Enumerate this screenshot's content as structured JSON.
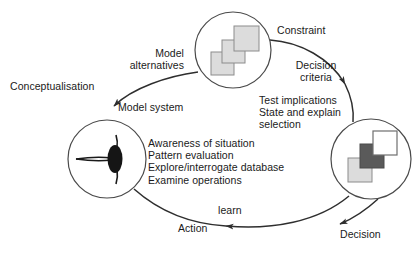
{
  "diagram": {
    "type": "cycle-diagram",
    "colors": {
      "stroke": "#3c3c3c",
      "text": "#1a1a1a",
      "square_light": "#dcdcdc",
      "square_dark": "#5a5a5a",
      "square_white": "#ffffff",
      "square_border": "#8c8c8c",
      "background": "#ffffff"
    },
    "nodes": [
      {
        "id": "model-alternatives-node",
        "position": "top",
        "icon": "three-light-squares",
        "squares": [
          {
            "name": "square-lower-left",
            "fill": "#dcdcdc"
          },
          {
            "name": "square-middle",
            "fill": "#dcdcdc"
          },
          {
            "name": "square-upper-right",
            "fill": "#dcdcdc"
          }
        ]
      },
      {
        "id": "observation-eye-node",
        "position": "left",
        "icon": "eye"
      },
      {
        "id": "decision-node",
        "position": "right",
        "icon": "three-squares-contrast",
        "squares": [
          {
            "name": "square-lower-left",
            "fill": "#dcdcdc"
          },
          {
            "name": "square-middle",
            "fill": "#5a5a5a"
          },
          {
            "name": "square-upper-right",
            "fill": "#ffffff"
          }
        ]
      }
    ],
    "labels": {
      "conceptualisation": "Conceptualisation",
      "model_alternatives": "Model\nalternatives",
      "model_system": "Model system",
      "constraint": "Constraint",
      "decision_criteria": "Decision\ncriteria",
      "test_block": "Test implications\nState and explain\nselection",
      "center_block": "Awareness of situation\nPattern evaluation\nExplore/interrogate database\nExamine operations",
      "learn": "learn",
      "action": "Action",
      "decision": "Decision"
    },
    "arrows": [
      {
        "name": "arrow-model-system",
        "from": "model-alternatives-node",
        "to": "observation-eye-node",
        "label": "Model system"
      },
      {
        "name": "arrow-constraint-decision",
        "from": "model-alternatives-node",
        "to": "decision-node",
        "label": "Decision"
      },
      {
        "name": "arrow-learn-action",
        "from": "decision-node",
        "to": "observation-eye-node",
        "label": "Action"
      },
      {
        "name": "arrow-decision-outer",
        "from": "decision-node",
        "to": "bottom-right",
        "label": "Decision"
      }
    ]
  }
}
